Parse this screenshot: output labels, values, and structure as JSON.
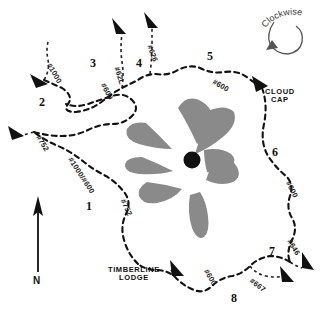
{
  "map": {
    "title": "Mount Hood Timberline Trail Loop Map",
    "direction_note": "Clockwise",
    "compass_label": "N",
    "summit_marker": "summit-dot",
    "glacier_color": "#8a8a8a",
    "trail_color": "#111111",
    "segment_numbers": [
      {
        "id": "1",
        "label": "1",
        "x": 86,
        "y": 200
      },
      {
        "id": "2",
        "label": "2",
        "x": 39,
        "y": 96
      },
      {
        "id": "3",
        "label": "3",
        "x": 90,
        "y": 57
      },
      {
        "id": "4",
        "label": "4",
        "x": 136,
        "y": 57
      },
      {
        "id": "5",
        "label": "5",
        "x": 207,
        "y": 50
      },
      {
        "id": "6",
        "label": "6",
        "x": 272,
        "y": 146
      },
      {
        "id": "7",
        "label": "7",
        "x": 269,
        "y": 245
      },
      {
        "id": "8",
        "label": "8",
        "x": 231,
        "y": 292
      }
    ],
    "trail_numbers": [
      {
        "label": "#1000",
        "x": 52,
        "y": 62,
        "rot": 60
      },
      {
        "label": "#600",
        "x": 106,
        "y": 82,
        "rot": 62
      },
      {
        "label": "#62L",
        "x": 120,
        "y": 66,
        "rot": 72
      },
      {
        "label": "#626",
        "x": 153,
        "y": 44,
        "rot": 70
      },
      {
        "label": "#600",
        "x": 215,
        "y": 78,
        "rot": 30
      },
      {
        "label": "#600",
        "x": 291,
        "y": 180,
        "rot": 62
      },
      {
        "label": "#646",
        "x": 292,
        "y": 238,
        "rot": 58
      },
      {
        "label": "#667",
        "x": 253,
        "y": 277,
        "rot": 38
      },
      {
        "label": "#600",
        "x": 209,
        "y": 268,
        "rot": 60
      },
      {
        "label": "#752",
        "x": 41,
        "y": 134,
        "rot": 58
      },
      {
        "label": "#1000/#600",
        "x": 73,
        "y": 156,
        "rot": 57
      },
      {
        "label": "#752",
        "x": 126,
        "y": 198,
        "rot": 65
      }
    ],
    "places": [
      {
        "name": "cloud-cap",
        "line1": "CLOUD",
        "line2": "CAP",
        "x": 268,
        "y": 92
      },
      {
        "name": "timberline-lodge",
        "line1": "TIMBERLINE",
        "line2": "LODGE",
        "x": 108,
        "y": 270
      }
    ],
    "trailhead_markers": [
      {
        "name": "trailhead-2",
        "x": 34,
        "y": 78,
        "rot": 30
      },
      {
        "name": "trailhead-1",
        "x": 12,
        "y": 130,
        "rot": 30
      },
      {
        "name": "trailhead-3",
        "x": 117,
        "y": 22,
        "rot": 15
      },
      {
        "name": "trailhead-4",
        "x": 148,
        "y": 16,
        "rot": 15
      },
      {
        "name": "trailhead-cloudcap",
        "x": 257,
        "y": 80,
        "rot": -20
      },
      {
        "name": "trailhead-7",
        "x": 306,
        "y": 258,
        "rot": -20
      },
      {
        "name": "trailhead-8",
        "x": 285,
        "y": 272,
        "rot": -20
      },
      {
        "name": "trailhead-timberline",
        "x": 174,
        "y": 265,
        "rot": -20
      }
    ]
  }
}
